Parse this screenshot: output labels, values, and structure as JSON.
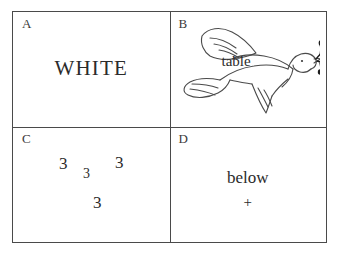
{
  "figure": {
    "background_color": "#ffffff",
    "border_color": "#4a4a4a",
    "ink_color": "#2b2b2b",
    "panels": [
      {
        "id": "a",
        "letter": "A",
        "kind": "word",
        "word": "WHITE"
      },
      {
        "id": "b",
        "letter": "B",
        "kind": "picture-with-word",
        "picture": "dove-with-olive-branch",
        "word": "table"
      },
      {
        "id": "c",
        "letter": "C",
        "kind": "digit-array",
        "digits": [
          {
            "value": "3",
            "left": 46,
            "top": 28,
            "size": 17
          },
          {
            "value": "3",
            "left": 70,
            "top": 40,
            "size": 14
          },
          {
            "value": "3",
            "left": 102,
            "top": 27,
            "size": 17
          },
          {
            "value": "3",
            "left": 80,
            "top": 67,
            "size": 17
          }
        ]
      },
      {
        "id": "d",
        "letter": "D",
        "kind": "word-with-mark",
        "word": "below",
        "mark": "+"
      }
    ]
  }
}
